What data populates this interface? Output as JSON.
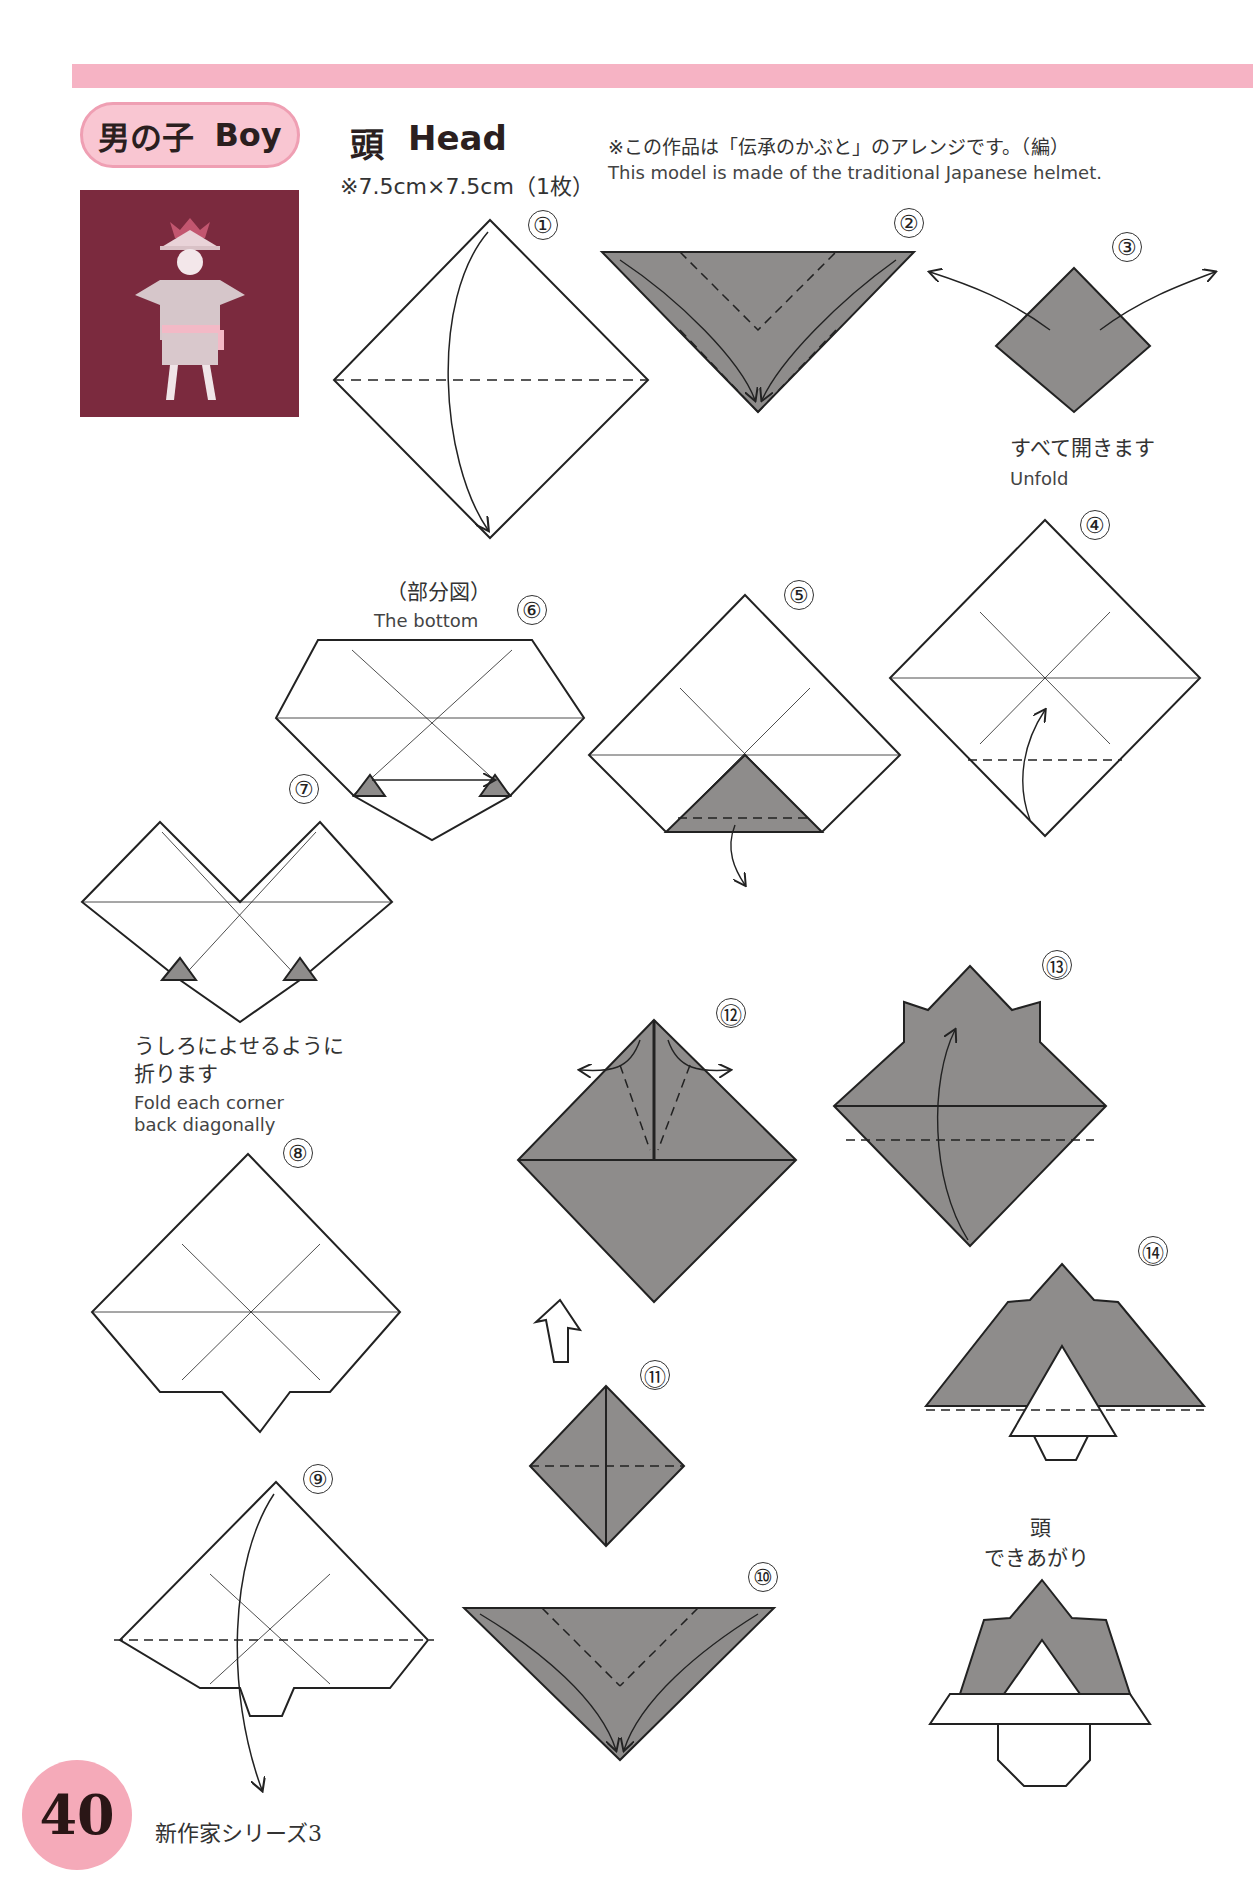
{
  "header": {
    "section_jp": "男の子",
    "section_en": "Boy",
    "title_jp": "頭",
    "title_en": "Head",
    "paper_size": "※7.5cm×7.5cm（1枚）",
    "note_jp": "※この作品は「伝承のかぶと」のアレンジです。（編）",
    "note_en": "This model is made of the traditional Japanese helmet."
  },
  "photo": {
    "alt": "Finished origami boy figure on maroon background",
    "bg_color": "#7b2a3e"
  },
  "steps": [
    {
      "num": "①"
    },
    {
      "num": "②"
    },
    {
      "num": "③",
      "caption_jp": "すべて開きます",
      "caption_en": "Unfold"
    },
    {
      "num": "④"
    },
    {
      "num": "⑤"
    },
    {
      "num": "⑥",
      "caption_jp": "（部分図）",
      "caption_en": "The bottom"
    },
    {
      "num": "⑦",
      "caption_jp_1": "うしろによせるように",
      "caption_jp_2": "折ります",
      "caption_en_1": "Fold each corner",
      "caption_en_2": "back diagonally"
    },
    {
      "num": "⑧"
    },
    {
      "num": "⑨"
    },
    {
      "num": "⑩"
    },
    {
      "num": "⑪"
    },
    {
      "num": "⑫"
    },
    {
      "num": "⑬"
    },
    {
      "num": "⑭"
    }
  ],
  "finished": {
    "label_1": "頭",
    "label_2": "できあがり"
  },
  "footer": {
    "page_number": "40",
    "series": "新作家シリーズ3"
  },
  "colors": {
    "accent_pink": "#f6b3c4",
    "paper_gray": "#8e8c8b",
    "photo_bg": "#7b2a3e"
  }
}
